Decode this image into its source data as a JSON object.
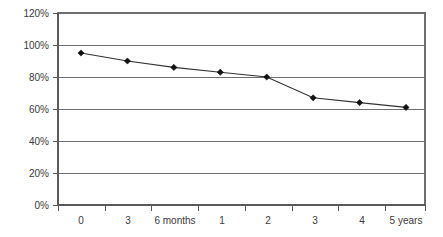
{
  "chart_data": {
    "type": "line",
    "title": "",
    "subtitle": "",
    "xlabel": "",
    "ylabel": "",
    "categories": [
      "0",
      "3",
      "6 months",
      "1",
      "2",
      "3",
      "4",
      "5 years"
    ],
    "x_tick_labels": [
      "0",
      "3",
      "6 months",
      "1",
      "2",
      "3",
      "4",
      "5 years"
    ],
    "y_tick_labels": [
      "0%",
      "20%",
      "40%",
      "60%",
      "80%",
      "100%",
      "120%"
    ],
    "y_tick_values": [
      0,
      20,
      40,
      60,
      80,
      100,
      120
    ],
    "values": [
      95,
      90,
      86,
      83,
      80,
      67,
      64,
      61
    ],
    "series": [
      {
        "name": "",
        "values": [
          95,
          90,
          86,
          83,
          80,
          67,
          64,
          61
        ]
      }
    ],
    "ylim": [
      0,
      120
    ],
    "xlim": [
      0,
      7
    ],
    "grid": "horizontal",
    "legend": "none",
    "marker": "diamond",
    "line_color": "#333333",
    "marker_color": "#111111",
    "grid_color": "#6f6f6f",
    "border_color": "#6f6f6f",
    "background_color": "#ffffff",
    "annotations": []
  }
}
